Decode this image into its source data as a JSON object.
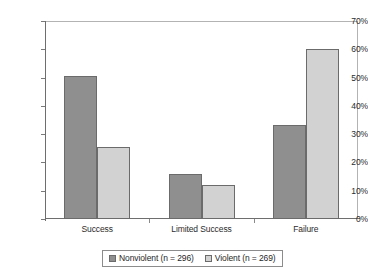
{
  "chart_data": {
    "type": "bar",
    "title": "",
    "subtitle": "",
    "xlabel": "",
    "ylabel": "",
    "categories": [
      "Success",
      "Limited Success",
      "Failure"
    ],
    "series": [
      {
        "name": "Nonviolent (n = 296)",
        "values": [
          50.5,
          16.0,
          33.2
        ],
        "color": "#8f8f8f"
      },
      {
        "name": "Violent (n = 269)",
        "values": [
          25.4,
          12.0,
          60.0
        ],
        "color": "#d2d2d2"
      }
    ],
    "ylim": [
      0,
      70
    ],
    "ytick_values": [
      0,
      10,
      20,
      30,
      40,
      50,
      60,
      70
    ],
    "ytick_labels": [
      "0%",
      "10%",
      "20%",
      "30%",
      "40%",
      "50%",
      "60%",
      "70%"
    ],
    "value_format": "percent",
    "grid": false,
    "legend_position": "bottom-center",
    "legend_border": true,
    "bar_border_color": "#6b6b6b",
    "axis_color": "#6e6e6e",
    "background": "#ffffff"
  }
}
